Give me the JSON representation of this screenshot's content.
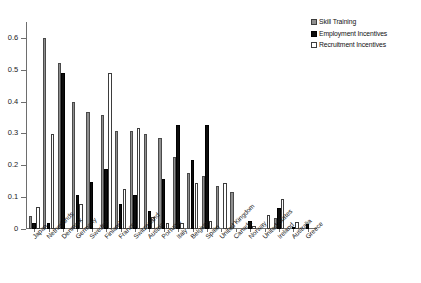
{
  "chart_data": {
    "type": "bar",
    "title": "",
    "subtitle": "",
    "xlabel": "",
    "ylabel": "",
    "ylim": [
      0,
      0.65
    ],
    "yticks": [
      0,
      0.1,
      0.2,
      0.3,
      0.4,
      0.5,
      0.6
    ],
    "ytick_labels": [
      "0",
      "0.1",
      "0.2",
      "0.3",
      "0.4",
      "0.5",
      "0.6"
    ],
    "grid": false,
    "legend_position": "top-right",
    "categories": [
      "Japan",
      "Netherlands",
      "Denmark",
      "Germany",
      "Sweden",
      "Finland",
      "France",
      "Switzerland",
      "Austria",
      "Portugal",
      "Italy",
      "Belgium",
      "Spain",
      "United Kingdom",
      "Canada",
      "Norway",
      "United States",
      "Ireland",
      "Australia",
      "Greece"
    ],
    "series": [
      {
        "name": "Skill Training",
        "color": "#8f8f8f",
        "values": [
          0.04,
          0.6,
          0.52,
          0.4,
          0.368,
          0.358,
          0.308,
          0.307,
          0.298,
          0.287,
          0.226,
          0.176,
          0.167,
          0.136,
          0.116,
          0.0,
          0.0,
          0.035,
          0.0,
          0.0
        ]
      },
      {
        "name": "Employment Incentives",
        "color": "#0d0d0d",
        "values": [
          0.019,
          0.018,
          0.489,
          0.108,
          0.147,
          0.189,
          0.077,
          0.108,
          0.056,
          0.157,
          0.326,
          0.217,
          0.326,
          0.0,
          0.0,
          0.026,
          0.0,
          0.065,
          0.007,
          0.016
        ]
      },
      {
        "name": "Recruitment Incentives",
        "color": "#ffffff",
        "values": [
          0.068,
          0.299,
          0.0,
          0.078,
          0.0,
          0.489,
          0.126,
          0.316,
          0.037,
          0.018,
          0.018,
          0.145,
          0.026,
          0.145,
          0.0,
          0.008,
          0.045,
          0.094,
          0.022,
          0.0
        ]
      }
    ]
  },
  "legend": {
    "items": [
      {
        "label": "Skill Training",
        "key": "skill"
      },
      {
        "label": "Employment Incentives",
        "key": "employment"
      },
      {
        "label": "Recruitment Incentives",
        "key": "recruitment"
      }
    ]
  }
}
